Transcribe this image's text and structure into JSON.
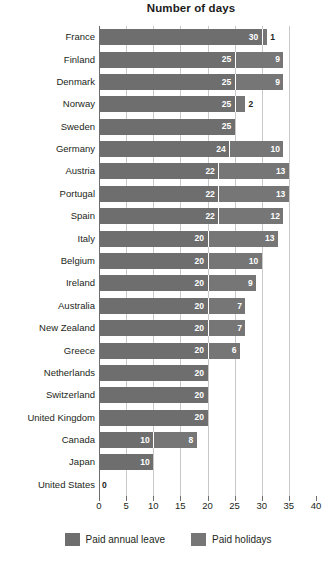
{
  "chart_data": {
    "type": "bar",
    "orientation": "horizontal",
    "stacked": true,
    "title": "Number of days",
    "xlabel": "",
    "ylabel": "",
    "xlim": [
      0,
      40
    ],
    "xticks": [
      0,
      5,
      10,
      15,
      20,
      25,
      30,
      35,
      40
    ],
    "grid": true,
    "legend_position": "bottom",
    "categories": [
      "France",
      "Finland",
      "Denmark",
      "Norway",
      "Sweden",
      "Germany",
      "Austria",
      "Portugal",
      "Spain",
      "Italy",
      "Belgium",
      "Ireland",
      "Australia",
      "New Zealand",
      "Greece",
      "Netherlands",
      "Switzerland",
      "United Kingdom",
      "Canada",
      "Japan",
      "United States"
    ],
    "series": [
      {
        "name": "Paid annual leave",
        "color": "#6e6e6e",
        "values": [
          30,
          25,
          25,
          25,
          25,
          24,
          22,
          22,
          22,
          20,
          20,
          20,
          20,
          20,
          20,
          20,
          20,
          20,
          10,
          10,
          0
        ]
      },
      {
        "name": "Paid holidays",
        "color": "#767676",
        "values": [
          1,
          9,
          9,
          2,
          0,
          10,
          13,
          13,
          12,
          13,
          10,
          9,
          7,
          7,
          6,
          0,
          0,
          0,
          8,
          0,
          0
        ]
      }
    ],
    "totals": [
      31,
      34,
      34,
      27,
      25,
      34,
      35,
      35,
      34,
      33,
      30,
      29,
      27,
      27,
      26,
      20,
      20,
      20,
      18,
      10,
      0
    ]
  },
  "legend": {
    "items": [
      {
        "label": "Paid annual leave",
        "color": "#6e6e6e"
      },
      {
        "label": "Paid holidays",
        "color": "#767676"
      }
    ]
  },
  "axis": {
    "tick_labels": [
      "0",
      "5",
      "10",
      "15",
      "20",
      "25",
      "30",
      "35",
      "40"
    ]
  }
}
